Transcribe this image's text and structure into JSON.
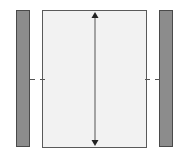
{
  "diagram": {
    "colors": {
      "side_bar_fill": "#8c8c8c",
      "side_bar_border": "#4a4a4a",
      "panel_fill": "#f2f2f2",
      "panel_border": "#5a5a5a",
      "arrow": "#222222"
    },
    "elements": [
      {
        "name": "left-side-bar",
        "x": 16,
        "y": 10,
        "w": 14,
        "h": 137
      },
      {
        "name": "center-panel",
        "x": 42,
        "y": 10,
        "w": 105,
        "h": 138
      },
      {
        "name": "right-side-bar",
        "x": 159,
        "y": 10,
        "w": 14,
        "h": 137
      },
      {
        "name": "height-arrow",
        "x": 95,
        "y1": 12,
        "y2": 146
      }
    ],
    "labels": []
  }
}
